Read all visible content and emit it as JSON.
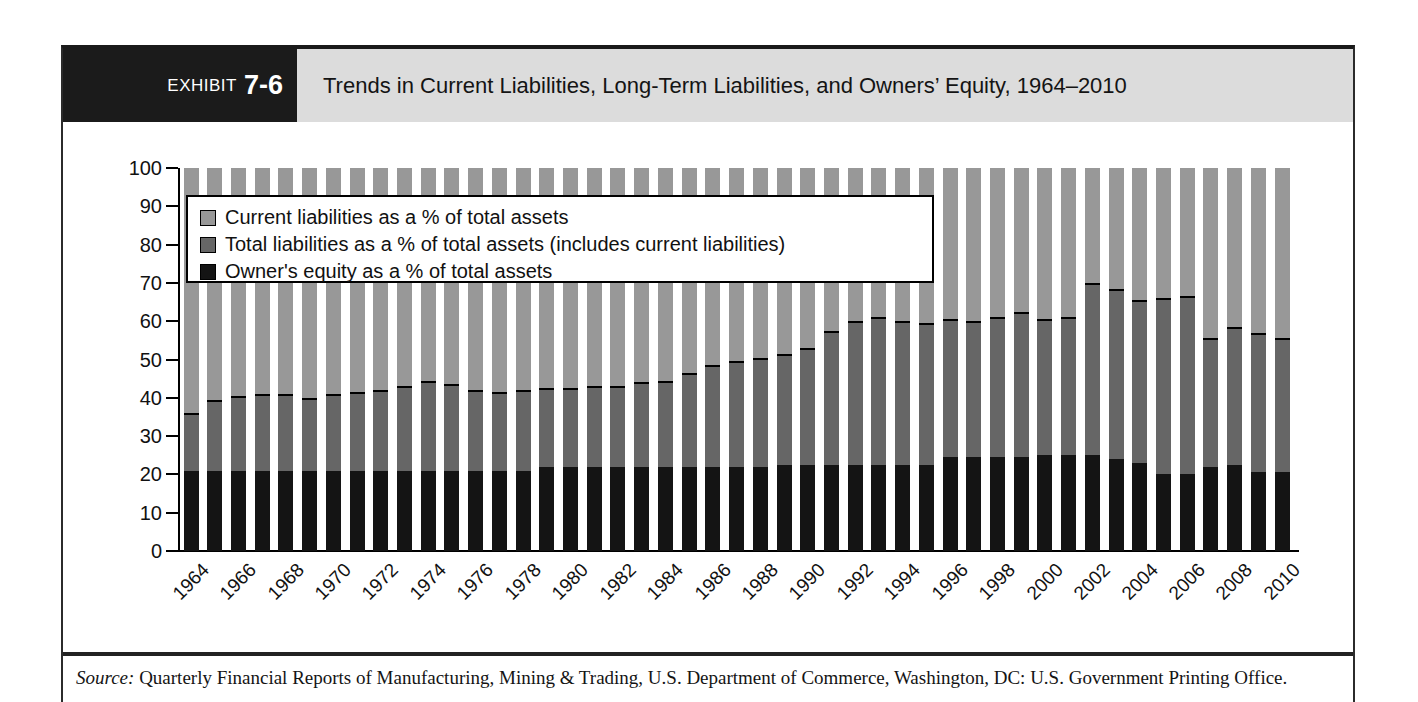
{
  "header": {
    "exhibit_label": "EXHIBIT",
    "exhibit_number": "7-6",
    "title": "Trends in Current Liabilities, Long-Term Liabilities, and Owners’ Equity, 1964–2010"
  },
  "source": {
    "prefix": "Source:",
    "text": " Quarterly Financial Reports of Manufacturing, Mining & Trading, U.S. Department of Commerce, Washington, DC: U.S. Government Printing Office."
  },
  "colors": {
    "current_liabilities": "#989898",
    "total_liabilities": "#666666",
    "owners_equity": "#141414",
    "boundary_line": "#000000",
    "header_band": "#dcdcdc",
    "exhibit_tag": "#1b1b1b"
  },
  "chart_data": {
    "type": "bar",
    "stacked": true,
    "title": "Trends in Current Liabilities, Long-Term Liabilities, and Owners’ Equity, 1964–2010",
    "xlabel": "",
    "ylabel": "",
    "ylim": [
      0,
      100
    ],
    "grid": false,
    "legend_position": "upper-left-inside",
    "y_ticks": [
      0,
      10,
      20,
      30,
      40,
      50,
      60,
      70,
      80,
      90,
      100
    ],
    "x_tick_labels": [
      "1964",
      "1966",
      "1968",
      "1970",
      "1972",
      "1974",
      "1976",
      "1978",
      "1980",
      "1982",
      "1984",
      "1986",
      "1988",
      "1990",
      "1992",
      "1994",
      "1996",
      "1998",
      "2000",
      "2002",
      "2004",
      "2006",
      "2008",
      "2010"
    ],
    "legend": [
      {
        "label": "Current liabilities as a % of total assets",
        "color": "#989898",
        "segment": "top"
      },
      {
        "label": "Total liabilities as a % of total assets (includes current liabilities)",
        "color": "#666666",
        "segment": "middle"
      },
      {
        "label": "Owner's equity as a % of total assets",
        "color": "#141414",
        "segment": "bottom"
      }
    ],
    "bars_note": "black_top = top of bottom black segment (%); boundary = top of dark-gray segment (%); light-gray segment fills to 100",
    "bars": [
      {
        "year": 1964,
        "black_top": 21,
        "boundary": 36
      },
      {
        "year": 1965,
        "black_top": 21,
        "boundary": 39.5
      },
      {
        "year": 1966,
        "black_top": 21,
        "boundary": 40.5
      },
      {
        "year": 1967,
        "black_top": 21,
        "boundary": 41
      },
      {
        "year": 1968,
        "black_top": 21,
        "boundary": 41
      },
      {
        "year": 1969,
        "black_top": 21,
        "boundary": 40
      },
      {
        "year": 1970,
        "black_top": 21,
        "boundary": 41
      },
      {
        "year": 1971,
        "black_top": 21,
        "boundary": 41.5
      },
      {
        "year": 1972,
        "black_top": 21,
        "boundary": 42
      },
      {
        "year": 1973,
        "black_top": 21,
        "boundary": 43
      },
      {
        "year": 1974,
        "black_top": 21,
        "boundary": 44.5
      },
      {
        "year": 1975,
        "black_top": 21,
        "boundary": 43.5
      },
      {
        "year": 1976,
        "black_top": 21,
        "boundary": 42
      },
      {
        "year": 1977,
        "black_top": 21,
        "boundary": 41.5
      },
      {
        "year": 1978,
        "black_top": 21,
        "boundary": 42
      },
      {
        "year": 1979,
        "black_top": 22,
        "boundary": 42.5
      },
      {
        "year": 1980,
        "black_top": 22,
        "boundary": 42.5
      },
      {
        "year": 1981,
        "black_top": 22,
        "boundary": 43
      },
      {
        "year": 1982,
        "black_top": 22,
        "boundary": 43
      },
      {
        "year": 1983,
        "black_top": 22,
        "boundary": 44
      },
      {
        "year": 1984,
        "black_top": 22,
        "boundary": 44.5
      },
      {
        "year": 1985,
        "black_top": 22,
        "boundary": 46.5
      },
      {
        "year": 1986,
        "black_top": 22,
        "boundary": 48.5
      },
      {
        "year": 1987,
        "black_top": 22,
        "boundary": 49.5
      },
      {
        "year": 1988,
        "black_top": 22,
        "boundary": 50.5
      },
      {
        "year": 1989,
        "black_top": 22.5,
        "boundary": 51.5
      },
      {
        "year": 1990,
        "black_top": 22.5,
        "boundary": 53
      },
      {
        "year": 1991,
        "black_top": 22.5,
        "boundary": 57.5
      },
      {
        "year": 1992,
        "black_top": 22.5,
        "boundary": 60
      },
      {
        "year": 1993,
        "black_top": 22.5,
        "boundary": 61
      },
      {
        "year": 1994,
        "black_top": 22.5,
        "boundary": 60
      },
      {
        "year": 1995,
        "black_top": 22.5,
        "boundary": 59.5
      },
      {
        "year": 1996,
        "black_top": 24.5,
        "boundary": 60.5
      },
      {
        "year": 1997,
        "black_top": 24.5,
        "boundary": 60
      },
      {
        "year": 1998,
        "black_top": 24.5,
        "boundary": 61
      },
      {
        "year": 1999,
        "black_top": 24.5,
        "boundary": 62.5
      },
      {
        "year": 2000,
        "black_top": 25,
        "boundary": 60.5
      },
      {
        "year": 2001,
        "black_top": 25,
        "boundary": 61
      },
      {
        "year": 2002,
        "black_top": 25,
        "boundary": 70
      },
      {
        "year": 2003,
        "black_top": 24,
        "boundary": 68.5
      },
      {
        "year": 2004,
        "black_top": 23,
        "boundary": 65.5
      },
      {
        "year": 2005,
        "black_top": 20,
        "boundary": 66
      },
      {
        "year": 2006,
        "black_top": 20,
        "boundary": 66.5
      },
      {
        "year": 2007,
        "black_top": 22,
        "boundary": 55.5
      },
      {
        "year": 2008,
        "black_top": 22.5,
        "boundary": 58.5
      },
      {
        "year": 2009,
        "black_top": 20.5,
        "boundary": 57
      },
      {
        "year": 2010,
        "black_top": 20.5,
        "boundary": 55.5
      }
    ]
  }
}
